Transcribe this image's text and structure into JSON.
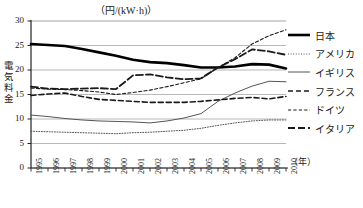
{
  "chart_data": {
    "type": "line",
    "title": "",
    "unit_label": "（円/(kW·h)）",
    "ylabel": "電気料金",
    "xlabel": "（年）",
    "x": [
      1995,
      1996,
      1997,
      1998,
      1999,
      2000,
      2001,
      2002,
      2003,
      2004,
      2005,
      2006,
      2007,
      2008,
      2009,
      2010
    ],
    "xlim": [
      1995,
      2010
    ],
    "ylim": [
      0,
      30
    ],
    "yticks": [
      0,
      5,
      10,
      15,
      20,
      25,
      30
    ],
    "xticks": [
      "1995",
      "1996",
      "1997",
      "1998",
      "1999",
      "2000",
      "2001",
      "2002",
      "2003",
      "2004",
      "2005",
      "2006",
      "2007",
      "2008",
      "2009",
      "2010"
    ],
    "grid": "horizontal",
    "legend_position": "right",
    "series": [
      {
        "name": "日本",
        "style": "thick-solid",
        "color": "#000000",
        "values": [
          25.3,
          25.1,
          24.9,
          24.3,
          23.6,
          22.9,
          22.1,
          21.6,
          21.4,
          21.0,
          20.5,
          20.5,
          20.7,
          21.2,
          21.1,
          20.3
        ]
      },
      {
        "name": "アメリカ",
        "style": "dotted",
        "color": "#555555",
        "values": [
          7.5,
          7.4,
          7.3,
          7.2,
          7.1,
          7.0,
          7.2,
          7.3,
          7.5,
          7.7,
          8.1,
          8.7,
          9.2,
          9.6,
          9.8,
          9.8
        ]
      },
      {
        "name": "イギリス",
        "style": "thin-solid",
        "color": "#555555",
        "values": [
          10.8,
          10.5,
          10.1,
          9.8,
          9.6,
          9.5,
          9.4,
          9.2,
          9.6,
          10.2,
          11.1,
          13.6,
          15.3,
          16.7,
          17.7,
          17.6
        ]
      },
      {
        "name": "フランス",
        "style": "dashed",
        "color": "#1a1a1a",
        "values": [
          14.8,
          15.1,
          15.3,
          14.6,
          14.0,
          13.8,
          13.6,
          13.4,
          13.4,
          13.4,
          13.6,
          13.9,
          14.2,
          14.4,
          14.1,
          14.6
        ]
      },
      {
        "name": "ドイツ",
        "style": "fine-dashed",
        "color": "#1a1a1a",
        "values": [
          16.3,
          16.1,
          16.0,
          15.8,
          15.5,
          15.0,
          15.4,
          15.9,
          16.6,
          17.4,
          18.2,
          20.5,
          22.5,
          25.3,
          27.0,
          28.2
        ]
      },
      {
        "name": "イタリア",
        "style": "long-dashed",
        "color": "#1a1a1a",
        "values": [
          16.6,
          16.2,
          16.1,
          16.2,
          16.3,
          16.1,
          18.9,
          19.1,
          18.5,
          18.1,
          18.3,
          20.5,
          22.2,
          24.2,
          23.8,
          23.1
        ]
      }
    ]
  }
}
